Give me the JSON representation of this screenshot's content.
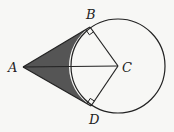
{
  "diagram": {
    "points": {
      "A": {
        "label": "A",
        "x": 23,
        "y": 67
      },
      "B": {
        "label": "B",
        "x": 90,
        "y": 27
      },
      "C": {
        "label": "C",
        "x": 118,
        "y": 66
      },
      "D": {
        "label": "D",
        "x": 91,
        "y": 106
      }
    },
    "circle": {
      "center": "C",
      "radius": 47
    },
    "segments": [
      "AB",
      "AD",
      "AC",
      "BC",
      "DC"
    ],
    "right_angles": [
      "B",
      "D"
    ],
    "shaded_region": "bounded by AB, AD and minor arc BD",
    "colors": {
      "stroke": "#222222",
      "shade": "#555555",
      "background": "#f7f7f5"
    }
  }
}
